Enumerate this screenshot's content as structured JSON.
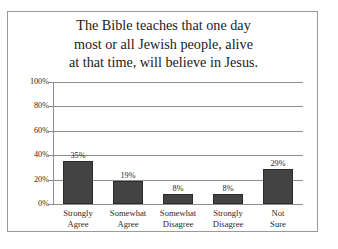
{
  "chart_data": {
    "type": "bar",
    "title": "The Bible teaches that one day most or all Jewish people, alive at that time, will believe in Jesus.",
    "title_lines": [
      "The Bible teaches that one day",
      "most or all Jewish people, alive",
      "at that time, will believe in Jesus."
    ],
    "categories": [
      "Strongly Agree",
      "Somewhat Agree",
      "Somewhat Disagree",
      "Strongly Disagree",
      "Not Sure"
    ],
    "category_lines": [
      [
        "Strongly",
        "Agree"
      ],
      [
        "Somewhat",
        "Agree"
      ],
      [
        "Somewhat",
        "Disagree"
      ],
      [
        "Strongly",
        "Disagree"
      ],
      [
        "Not",
        "Sure"
      ]
    ],
    "values": [
      35,
      19,
      8,
      8,
      29
    ],
    "value_labels": [
      "35%",
      "19%",
      "8%",
      "8%",
      "29%"
    ],
    "xlabel": "",
    "ylabel": "",
    "ylim": [
      0,
      100
    ],
    "yticks": [
      0,
      20,
      40,
      60,
      80,
      100
    ],
    "ytick_labels": [
      "0%",
      "20%",
      "40%",
      "60%",
      "80%",
      "100%"
    ],
    "grid": true,
    "legend": false,
    "bar_color": "#434343",
    "gridline_color": "#8d8d8d",
    "frame_color": "#9a9a9a",
    "text_color": "#2a2a2a"
  }
}
